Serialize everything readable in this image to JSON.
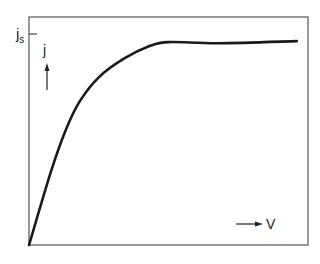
{
  "chart_data": {
    "type": "line",
    "title": "",
    "xlabel": "V",
    "ylabel": "j",
    "y_tick_labels": [
      "j_s"
    ],
    "grid": false,
    "legend": null,
    "series": [
      {
        "name": "j(V)",
        "x": [
          0,
          0.08,
          0.13,
          0.18,
          0.25,
          0.34,
          0.43,
          0.5,
          0.68,
          0.96
        ],
        "y": [
          0,
          0.36,
          0.55,
          0.69,
          0.81,
          0.9,
          0.96,
          0.98,
          0.975,
          0.985
        ]
      }
    ],
    "saturation_label": "j_s",
    "xlim": [
      0,
      1
    ],
    "ylim": [
      0,
      1.08
    ]
  },
  "labels": {
    "js_main": "j",
    "js_sub": "s",
    "y_axis": "j",
    "x_axis": "V"
  },
  "colors": {
    "curve": "#1a1a1a",
    "frame": "#555555"
  }
}
